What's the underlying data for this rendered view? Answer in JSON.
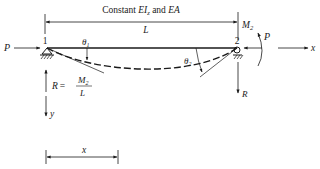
{
  "labels": {
    "property_text_prefix": "Constant ",
    "property_EI": "EI",
    "property_EI_sub": "z",
    "property_and": " and ",
    "property_EA": "EA",
    "length": "L",
    "node1": "1",
    "node2": "2",
    "theta1": "θ",
    "theta1_sub": "1",
    "theta2": "θ",
    "theta2_sub": "2",
    "P_left": "P",
    "P_right": "P",
    "M2": "M",
    "M2_sub": "2",
    "x_axis": "x",
    "y_axis": "y",
    "R_left": "R",
    "R_eq": "=",
    "R_num": "M",
    "R_num_sub": "2",
    "R_den": "L",
    "R_right": "R",
    "x_dim": "x"
  },
  "colors": {
    "line": "#1a1a1a",
    "background": "#ffffff"
  }
}
